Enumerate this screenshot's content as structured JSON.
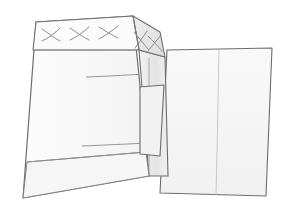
{
  "canvas": {
    "width": 284,
    "height": 219,
    "background": "#ffffff"
  },
  "illustration": {
    "title": "Carton with hinged side flap",
    "type": "technical-line-drawing",
    "style": "isometric pencil sketch, thin gray outlines, flat light-gray fills"
  },
  "palette": {
    "background": "#ffffff",
    "face_front": "#fafafa",
    "face_front_lower": "#f4f4f4",
    "face_top_band": "#f7f7f7",
    "face_bevel": "#e6e6e6",
    "face_side": "#ebebeb",
    "face_tab": "#f0f0f0",
    "panel_right": "#f6f6f6",
    "outline": "#6d6d6d",
    "outline_soft": "#9a9a9a",
    "fold_line": "#a8a8a8",
    "hatch_mark": "#8d8d92"
  },
  "shapes": {
    "box": {
      "name": "carton-body",
      "front_face": "36,22 133,16 149,176 23,198",
      "top_band": "36,22 133,16 139,50 33,50",
      "front_lower_band": "27,162 146,152 149,176 23,198",
      "bevel_face": "133,16 160,32 165,57 139,50",
      "side_face": "139,50 165,57 168,176 149,176",
      "fold_lines": [
        {
          "name": "top-band-fold",
          "path": "33,50 139,50"
        },
        {
          "name": "upper-mid-fold",
          "path": "88,77 139,74"
        },
        {
          "name": "lower-mid-fold",
          "path": "84,146 146,143"
        },
        {
          "name": "bottom-band-fold",
          "path": "27,162 146,152"
        },
        {
          "name": "side-seam",
          "path": "149,176 149,58"
        }
      ]
    },
    "tab": {
      "name": "connector-tab",
      "outline": "140,87 164,85 160,156 140,154"
    },
    "panel": {
      "name": "right-lid-panel",
      "outline": "167,50 272,48 266,196 160,193",
      "crease": "219,49 216,195"
    }
  },
  "hatching": {
    "top_band_marks": [
      {
        "name": "x-mark-1",
        "cx": 51,
        "cy": 35
      },
      {
        "name": "x-mark-2",
        "cx": 79,
        "cy": 34
      },
      {
        "name": "x-mark-3",
        "cx": 108,
        "cy": 32
      }
    ],
    "bevel_marks": [
      {
        "name": "x-mark-4",
        "cx": 141,
        "cy": 40
      },
      {
        "name": "x-mark-5",
        "cx": 153,
        "cy": 45
      }
    ],
    "count_top": 3,
    "count_bevel": 2
  }
}
